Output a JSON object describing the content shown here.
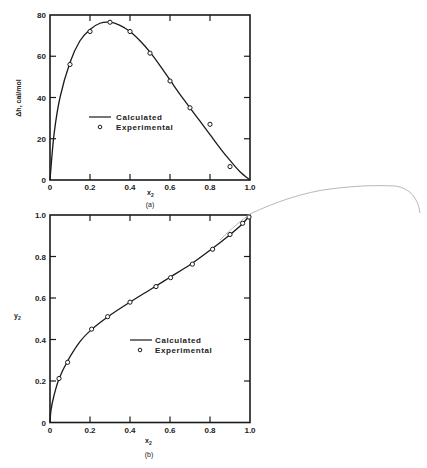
{
  "chart_data": [
    {
      "type": "line",
      "panel": "(a)",
      "title": "",
      "xlabel": "x2",
      "ylabel": "Δh, cal/mol",
      "xlim": [
        0,
        1.0
      ],
      "ylim": [
        0,
        80
      ],
      "xticks": [
        "0",
        "0.2",
        "0.4",
        "0.6",
        "0.8",
        "1.0"
      ],
      "yticks": [
        "0",
        "20",
        "40",
        "60",
        "80"
      ],
      "grid": false,
      "legend": [
        "Calculated",
        "Experimental"
      ],
      "legend_position": "center-left inside",
      "series": [
        {
          "name": "Calculated",
          "style": "line",
          "x": [
            0,
            0.02,
            0.05,
            0.1,
            0.15,
            0.2,
            0.25,
            0.3,
            0.35,
            0.4,
            0.45,
            0.5,
            0.55,
            0.6,
            0.65,
            0.7,
            0.75,
            0.8,
            0.85,
            0.9,
            0.95,
            1.0
          ],
          "y": [
            0,
            22,
            40,
            57,
            67.5,
            73,
            76,
            76.5,
            75,
            72,
            67.5,
            62,
            55.5,
            48.5,
            41.5,
            35,
            28.5,
            22,
            15.5,
            9.5,
            4,
            0
          ]
        },
        {
          "name": "Experimental",
          "style": "markers",
          "x": [
            0.1,
            0.2,
            0.3,
            0.4,
            0.5,
            0.6,
            0.7,
            0.8,
            0.9
          ],
          "y": [
            56,
            72,
            76.5,
            72,
            61.5,
            48,
            35,
            27,
            6.5
          ]
        }
      ]
    },
    {
      "type": "line",
      "panel": "(b)",
      "title": "",
      "xlabel": "x2",
      "ylabel": "y2",
      "xlim": [
        0,
        1.0
      ],
      "ylim": [
        0,
        1.0
      ],
      "xticks": [
        "0",
        "0.2",
        "0.4",
        "0.6",
        "0.8",
        "1.0"
      ],
      "yticks": [
        "0",
        "0.2",
        "0.4",
        "0.6",
        "0.8",
        "1.0"
      ],
      "grid": false,
      "legend": [
        "Calculated",
        "Experimental"
      ],
      "legend_position": "center inside",
      "series": [
        {
          "name": "Calculated",
          "style": "line",
          "x": [
            0,
            0.005,
            0.02,
            0.045,
            0.09,
            0.15,
            0.21,
            0.29,
            0.4,
            0.5,
            0.6,
            0.7,
            0.8,
            0.9,
            0.96,
            1.0
          ],
          "y": [
            0,
            0.06,
            0.13,
            0.21,
            0.3,
            0.39,
            0.45,
            0.51,
            0.58,
            0.64,
            0.7,
            0.76,
            0.83,
            0.905,
            0.955,
            1.0
          ]
        },
        {
          "name": "Experimental",
          "style": "markers",
          "x": [
            0.045,
            0.088,
            0.208,
            0.288,
            0.4,
            0.53,
            0.603,
            0.712,
            0.813,
            0.9,
            0.963,
            0.995
          ],
          "y": [
            0.212,
            0.29,
            0.45,
            0.51,
            0.58,
            0.655,
            0.698,
            0.763,
            0.835,
            0.906,
            0.96,
            0.99
          ]
        }
      ]
    }
  ],
  "labels": {
    "a": {
      "ylabel": "Δh, cal/mol",
      "xlabel_main": "x",
      "xlabel_sub": "2",
      "caption": "(a)",
      "legend_line": "Calculated",
      "legend_marker": "Experimental"
    },
    "b": {
      "ylabel_main": "y",
      "ylabel_sub": "2",
      "xlabel_main": "x",
      "xlabel_sub": "2",
      "caption": "(b)",
      "legend_line": "Calculated",
      "legend_marker": "Experimental"
    }
  },
  "colors": {
    "ink": "#1a1a1a",
    "pencil": "#b0b0b0"
  }
}
